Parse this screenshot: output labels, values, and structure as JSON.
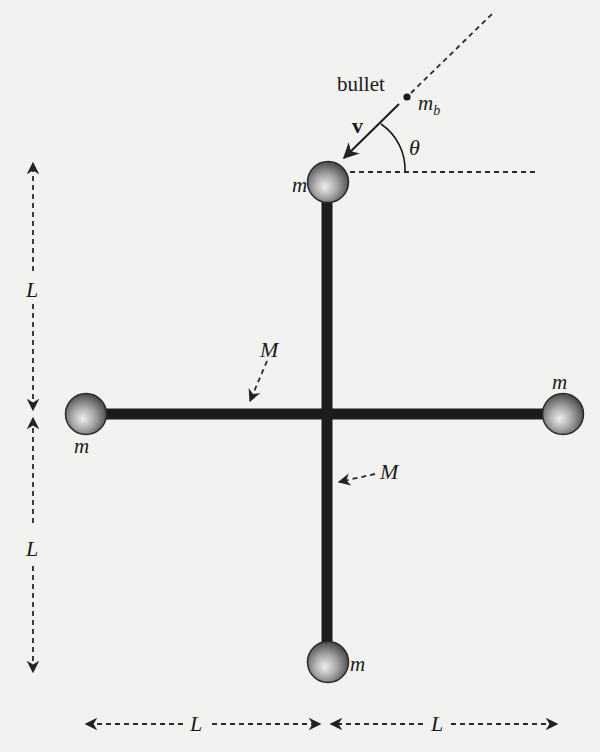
{
  "diagram": {
    "background_color": "#f2f2f0",
    "rod_color": "#1c1c1c",
    "sphere_color_light": "#e8e8e8",
    "sphere_color_dark": "#4a4a4a",
    "labels": {
      "bullet": "bullet",
      "bullet_mass_base": "m",
      "bullet_mass_sub": "b",
      "velocity": "v",
      "angle": "θ",
      "mass_top": "m",
      "mass_left": "m",
      "mass_right": "m",
      "mass_bottom": "m",
      "rod_mass_horizontal": "M",
      "rod_mass_vertical": "M",
      "length_left_upper": "L",
      "length_left_lower": "L",
      "length_bottom_left": "L",
      "length_bottom_right": "L"
    },
    "components": {
      "rods": [
        {
          "name": "horizontal-rod",
          "mass": "M",
          "length": "2L"
        },
        {
          "name": "vertical-rod",
          "mass": "M",
          "length": "2L"
        }
      ],
      "point_masses": [
        {
          "position": "top",
          "mass": "m"
        },
        {
          "position": "left",
          "mass": "m"
        },
        {
          "position": "right",
          "mass": "m"
        },
        {
          "position": "bottom",
          "mass": "m"
        }
      ],
      "projectile": {
        "name": "bullet",
        "mass": "m_b",
        "velocity": "v",
        "angle_from_horizontal": "θ",
        "target": "top mass"
      },
      "dimensions": [
        {
          "orientation": "vertical",
          "segment": "upper",
          "value": "L"
        },
        {
          "orientation": "vertical",
          "segment": "lower",
          "value": "L"
        },
        {
          "orientation": "horizontal",
          "segment": "left",
          "value": "L"
        },
        {
          "orientation": "horizontal",
          "segment": "right",
          "value": "L"
        }
      ]
    }
  }
}
